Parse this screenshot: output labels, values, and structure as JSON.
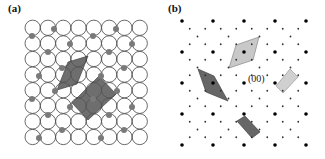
{
  "panels": [
    {
      "id": "a",
      "label": "(a)"
    },
    {
      "id": "b",
      "label": "(b)"
    }
  ],
  "panel_a": {
    "grid": {
      "cols": 8,
      "rows": 8,
      "x0": 25,
      "y0": 20,
      "pitch_x": 15.3,
      "pitch_y": 15.6
    },
    "circle_stroke": "#444444",
    "adatom_color": "#7a7a7a",
    "adatoms": [
      [
        32,
        36
      ],
      [
        54,
        29
      ],
      [
        93,
        36
      ],
      [
        116,
        29
      ],
      [
        48,
        52
      ],
      [
        70,
        44
      ],
      [
        109,
        52
      ],
      [
        132,
        44
      ],
      [
        39,
        76
      ],
      [
        62,
        68
      ],
      [
        101,
        76
      ],
      [
        124,
        68
      ],
      [
        32,
        99
      ],
      [
        55,
        91
      ],
      [
        93,
        99
      ],
      [
        117,
        91
      ],
      [
        48,
        115
      ],
      [
        70,
        107
      ],
      [
        109,
        115
      ],
      [
        132,
        107
      ],
      [
        39,
        138
      ],
      [
        62,
        130
      ],
      [
        101,
        138
      ],
      [
        124,
        130
      ]
    ],
    "unit_cells": [
      {
        "name": "rhombic-cell",
        "color": "#555555",
        "points": [
          [
            57,
            90
          ],
          [
            68,
            62
          ],
          [
            88,
            56
          ],
          [
            77,
            84
          ]
        ]
      },
      {
        "name": "rectangular-cell",
        "color": "#555555",
        "points": [
          [
            72,
            103
          ],
          [
            99,
            76
          ],
          [
            116,
            94
          ],
          [
            88,
            120
          ]
        ]
      }
    ]
  },
  "panel_b": {
    "lattice": {
      "cols": 5,
      "rows": 5,
      "x0": 20,
      "y0": 21,
      "pitch": 31
    },
    "main_spot_color": "#000000",
    "fractional_spot_color": "#333333",
    "fractional_offsets": [
      [
        0.25,
        0.25
      ],
      [
        0.5,
        0.5
      ],
      [
        0.75,
        0.75
      ],
      [
        0.75,
        0.25
      ],
      [
        0.25,
        0.75
      ]
    ],
    "origin_label": "(00)",
    "origin_label_pos": [
      86,
      73
    ],
    "cells": [
      {
        "name": "rhombic-cell-light",
        "color": "#c8c8c8",
        "stroke": "#888888",
        "points": [
          [
            97,
            37
          ],
          [
            74,
            45
          ],
          [
            67,
            68
          ],
          [
            91,
            60
          ]
        ]
      },
      {
        "name": "rhombic-cell-dark",
        "color": "#666666",
        "stroke": "#444444",
        "points": [
          [
            36,
            69
          ],
          [
            52,
            76
          ],
          [
            66,
            101
          ],
          [
            44,
            92
          ]
        ]
      },
      {
        "name": "rectangular-cell-light",
        "color": "#d0d0d0",
        "stroke": "#999999",
        "points": [
          [
            128,
            69
          ],
          [
            136,
            77
          ],
          [
            121,
            93
          ],
          [
            114,
            86
          ]
        ]
      },
      {
        "name": "rectangular-cell-dark",
        "color": "#666666",
        "stroke": "#444444",
        "points": [
          [
            75,
            121
          ],
          [
            83,
            116
          ],
          [
            98,
            132
          ],
          [
            90,
            138
          ]
        ]
      }
    ]
  }
}
